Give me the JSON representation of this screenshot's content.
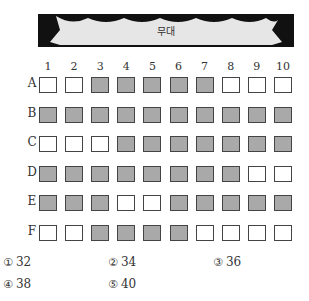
{
  "stage": {
    "label": "무대"
  },
  "seating": {
    "columns": [
      "1",
      "2",
      "3",
      "4",
      "5",
      "6",
      "7",
      "8",
      "9",
      "10"
    ],
    "rows": [
      {
        "label": "A",
        "seats": [
          0,
          0,
          1,
          1,
          1,
          1,
          1,
          0,
          0,
          0
        ]
      },
      {
        "label": "B",
        "seats": [
          1,
          1,
          1,
          1,
          1,
          1,
          1,
          1,
          1,
          1
        ]
      },
      {
        "label": "C",
        "seats": [
          0,
          0,
          0,
          1,
          1,
          1,
          1,
          1,
          1,
          1
        ]
      },
      {
        "label": "D",
        "seats": [
          1,
          1,
          1,
          1,
          1,
          1,
          1,
          1,
          0,
          0
        ]
      },
      {
        "label": "E",
        "seats": [
          1,
          1,
          1,
          0,
          0,
          1,
          1,
          1,
          1,
          1
        ]
      },
      {
        "label": "F",
        "seats": [
          0,
          0,
          1,
          1,
          1,
          1,
          0,
          0,
          0,
          0
        ]
      }
    ],
    "colors": {
      "taken": "#a9a9a9",
      "empty": "#ffffff",
      "border": "#444444"
    }
  },
  "choices": [
    {
      "num": "①",
      "value": "32"
    },
    {
      "num": "②",
      "value": "34"
    },
    {
      "num": "③",
      "value": "36"
    },
    {
      "num": "④",
      "value": "38"
    },
    {
      "num": "⑤",
      "value": "40"
    }
  ]
}
